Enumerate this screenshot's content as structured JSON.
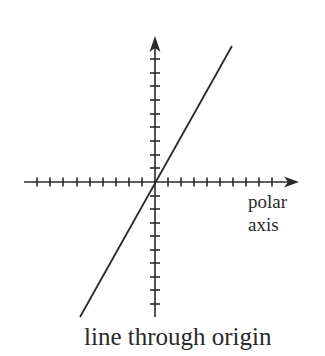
{
  "diagram": {
    "title": "line through origin",
    "axis_label_line1": "polar",
    "axis_label_line2": "axis",
    "colors": {
      "ink": "#2a2a2a",
      "background": "#ffffff"
    },
    "origin": [
      155,
      182
    ],
    "horizontal_axis": {
      "from_x": 24,
      "to_x": 299,
      "ticks_x": [
        37,
        50,
        63,
        77,
        90,
        103,
        116,
        129,
        142,
        168,
        181,
        194,
        207,
        220,
        233,
        246,
        259,
        272
      ]
    },
    "vertical_axis": {
      "from_y": 317,
      "to_y": 36,
      "ticks_y": [
        59,
        73,
        86,
        100,
        114,
        127,
        141,
        155,
        168,
        196,
        209,
        223,
        236,
        250,
        263,
        277,
        290,
        304
      ]
    },
    "line": {
      "x1": 80,
      "y1": 317,
      "x2": 232,
      "y2": 46
    }
  }
}
